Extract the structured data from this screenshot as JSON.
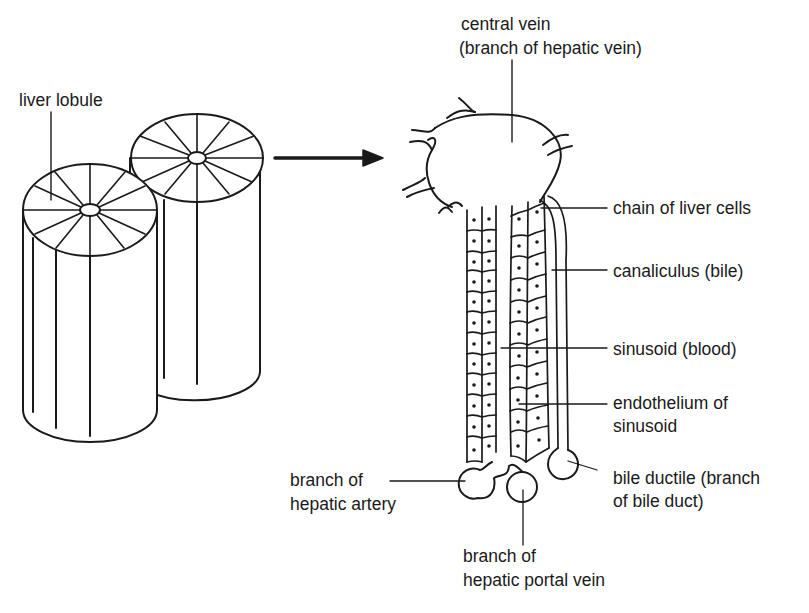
{
  "diagram": {
    "ink_color": "#1a1a1a",
    "background": "#ffffff",
    "left_panel": {
      "label": "liver lobule",
      "shapes": [
        "front-cylinder",
        "back-cylinder"
      ]
    },
    "arrow": {
      "direction": "right"
    },
    "right_panel": {
      "labels": {
        "central_vein_1": "central vein",
        "central_vein_2": "(branch of hepatic vein)",
        "chain": "chain of liver cells",
        "canaliculus": "canaliculus (bile)",
        "sinusoid": "sinusoid (blood)",
        "endothelium_1": "endothelium of",
        "endothelium_2": "sinusoid",
        "bile_ductile_1": "bile ductile (branch",
        "bile_ductile_2": "of bile duct)",
        "artery_1": "branch of",
        "artery_2": "hepatic artery",
        "portal_1": "branch of",
        "portal_2": "hepatic portal vein"
      }
    }
  }
}
